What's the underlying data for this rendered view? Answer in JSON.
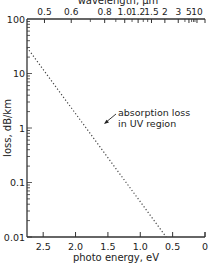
{
  "chart_data": {
    "type": "line",
    "title": "",
    "xlabel": "photo energy, eV",
    "x2label": "wavelength, μm",
    "ylabel": "loss, dB/km",
    "yscale": "log",
    "ylim": [
      0.01,
      100
    ],
    "xlim": [
      2.75,
      0
    ],
    "x_ticks": [
      "2.5",
      "2.0",
      "1.5",
      "1.0",
      "0.5",
      "0"
    ],
    "x_tick_values": [
      2.5,
      2.0,
      1.5,
      1.0,
      0.5,
      0
    ],
    "x2_ticks": [
      "0.5",
      "0.6",
      "0.8",
      "1.0",
      "1.2",
      "1.5",
      "2",
      "3",
      "5",
      "10"
    ],
    "x2_tick_values": [
      0.5,
      0.6,
      0.8,
      1.0,
      1.2,
      1.5,
      2,
      3,
      5,
      10
    ],
    "y_ticks": [
      "100",
      "10",
      "1",
      "0.1",
      "0.01"
    ],
    "y_tick_values": [
      100,
      10,
      1,
      0.1,
      0.01
    ],
    "grid": false,
    "series": [
      {
        "name": "absorption loss in UV region",
        "style": "dotted",
        "x": [
          2.75,
          2.0,
          1.5,
          1.0,
          0.6
        ],
        "y": [
          30,
          2.5,
          0.5,
          0.08,
          0.01
        ]
      }
    ],
    "annotations": [
      {
        "text": "absorption loss\nin UV region",
        "points_to": {
          "x": 1.6,
          "y": 0.4
        }
      }
    ]
  },
  "labels": {
    "xlabel": "photo energy, eV",
    "x2label": "wavelength, μm",
    "ylabel": "loss, dB/km",
    "annotation_line1": "absorption loss",
    "annotation_line2": "in UV region"
  }
}
